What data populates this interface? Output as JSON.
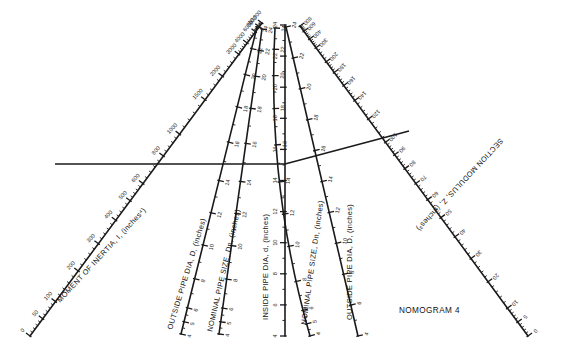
{
  "figure": {
    "caption": "NOMOGRAM 4",
    "background_color": "#ffffff",
    "ink_color": "#1a1a1a",
    "width": 565,
    "height": 359
  },
  "chart_data": {
    "type": "nomogram",
    "title": "NOMOGRAM 4",
    "grid": false,
    "legend": "none",
    "scales": [
      {
        "id": "moment-of-inertia",
        "name": "MOMENT OF INERTIA, I, (inches⁴)",
        "symbol": "I",
        "units": "inches^4",
        "orientation": "oblique-left-arm",
        "position": "far-left, rising to upper-centre",
        "label_rotation_deg": -47,
        "tick_labels": [
          "0",
          "50",
          "100",
          "200",
          "300",
          "400",
          "500",
          "600",
          "800",
          "1000",
          "1500",
          "2000",
          "3000",
          "4000",
          "6000",
          "8000",
          "10,000"
        ],
        "min": 0,
        "max": 10000,
        "scale_type": "non-linear"
      },
      {
        "id": "outside-pipe-dia-left",
        "name": "OUTSIDE PIPE DIA, D, (inches)",
        "symbol": "D",
        "units": "inches",
        "orientation": "oblique",
        "position": "left-of-centre",
        "label_rotation_deg": -72,
        "tick_labels": [
          "4",
          "5",
          "6",
          "8",
          "10",
          "12",
          "14",
          "16",
          "18",
          "20",
          "22",
          "24"
        ],
        "min": 4,
        "max": 24,
        "scale_type": "linear"
      },
      {
        "id": "nominal-pipe-size-left",
        "name": "NOMINAL PIPE SIZE, Dn, (inches)",
        "symbol": "Dn",
        "units": "inches",
        "orientation": "oblique",
        "position": "left-of-centre, inner",
        "label_rotation_deg": -78,
        "tick_labels": [
          "4",
          "5",
          "6",
          "8",
          "10",
          "12",
          "14",
          "16",
          "18",
          "20",
          "22",
          "24"
        ],
        "min": 4,
        "max": 24,
        "scale_type": "linear"
      },
      {
        "id": "inside-pipe-dia",
        "name": "INSIDE PIPE DIA, d, (inches)",
        "symbol": "d",
        "units": "inches",
        "orientation": "vertical",
        "position": "centre",
        "label_rotation_deg": -90,
        "tick_labels": [
          "4",
          "6",
          "8",
          "10",
          "12",
          "14",
          "16",
          "18",
          "20",
          "22",
          "24"
        ],
        "min": 4,
        "max": 24,
        "scale_type": "linear"
      },
      {
        "id": "nominal-pipe-size-right",
        "name": "NOMINAL PIPE SIZE, Dn, (inches)",
        "symbol": "Dn",
        "units": "inches",
        "orientation": "curved",
        "position": "right-of-centre, inner",
        "label_rotation_deg": -83,
        "tick_labels": [
          "4",
          "5",
          "6",
          "8",
          "10",
          "12",
          "14",
          "16",
          "18",
          "20",
          "22",
          "24"
        ],
        "min": 4,
        "max": 24,
        "scale_type": "non-linear"
      },
      {
        "id": "outside-pipe-dia-right",
        "name": "OUTSIDE PIPE DIA, D, (inches)",
        "symbol": "D",
        "units": "inches",
        "orientation": "oblique",
        "position": "right-of-centre",
        "label_rotation_deg": -90,
        "tick_labels": [
          "4",
          "6",
          "8",
          "10",
          "12",
          "14",
          "16",
          "18",
          "20",
          "22",
          "24"
        ],
        "min": 4,
        "max": 24,
        "scale_type": "linear"
      },
      {
        "id": "section-modulus",
        "name": "SECTION MODULUS, Z, (inches³)",
        "symbol": "Z",
        "units": "inches^3",
        "orientation": "oblique-right-arm",
        "position": "far-right, descending from upper-centre",
        "label_rotation_deg": 47,
        "label_flipped": true,
        "tick_labels": [
          "0",
          "5",
          "10",
          "20",
          "30",
          "40",
          "50",
          "60",
          "70",
          "80",
          "90",
          "100",
          "120",
          "140",
          "160",
          "180",
          "200",
          "300",
          "400",
          "600",
          "800"
        ],
        "min": 0,
        "max": 800,
        "scale_type": "non-linear"
      }
    ],
    "isopleth": {
      "description": "Index line example drawn across the chart",
      "readings": [
        {
          "scale": "moment-of-inertia",
          "value": "800"
        },
        {
          "scale": "outside-pipe-dia-left",
          "value": "14"
        },
        {
          "scale": "nominal-pipe-size-left",
          "value": "14"
        },
        {
          "scale": "inside-pipe-dia",
          "value": "12"
        },
        {
          "scale": "nominal-pipe-size-right",
          "value": "14"
        },
        {
          "scale": "outside-pipe-dia-right",
          "value": "14"
        },
        {
          "scale": "section-modulus",
          "value": "100"
        }
      ]
    }
  },
  "axis_labels": {
    "moment_of_inertia": "MOMENT OF INERTIA, I, (inches⁴)",
    "outside_pipe_dia_left": "OUTSIDE PIPE DIA, D, (inches)",
    "nominal_pipe_size_left": "NOMINAL PIPE SIZE, Dn, (inches)",
    "inside_pipe_dia": "INSIDE PIPE DIA, d, (inches)",
    "nominal_pipe_size_right": "NOMINAL PIPE SIZE, Dn, (inches)",
    "outside_pipe_dia_right": "OUTSIDE PIPE DIA, D, (inches)",
    "section_modulus": "SECTION MODULUS, Z, (inches³)"
  },
  "ticks": {
    "moment_of_inertia": [
      {
        "v": "0",
        "t": 0.0
      },
      {
        "v": "50",
        "t": 0.055
      },
      {
        "v": "100",
        "t": 0.11
      },
      {
        "v": "200",
        "t": 0.208
      },
      {
        "v": "300",
        "t": 0.295
      },
      {
        "v": "400",
        "t": 0.37
      },
      {
        "v": "500",
        "t": 0.432
      },
      {
        "v": "600",
        "t": 0.487
      },
      {
        "v": "800",
        "t": 0.575
      },
      {
        "v": "1000",
        "t": 0.645
      },
      {
        "v": "1500",
        "t": 0.755
      },
      {
        "v": "2000",
        "t": 0.83
      },
      {
        "v": "3000",
        "t": 0.9
      },
      {
        "v": "4000",
        "t": 0.936
      },
      {
        "v": "6000",
        "t": 0.972
      },
      {
        "v": "8000",
        "t": 0.988
      },
      {
        "v": "10,000",
        "t": 1.0
      }
    ],
    "outside_pipe_dia_left": [
      {
        "v": "4",
        "t": 0.0
      },
      {
        "v": "5",
        "t": 0.04
      },
      {
        "v": "6",
        "t": 0.085
      },
      {
        "v": "8",
        "t": 0.18
      },
      {
        "v": "10",
        "t": 0.29
      },
      {
        "v": "12",
        "t": 0.395
      },
      {
        "v": "14",
        "t": 0.5
      },
      {
        "v": "16",
        "t": 0.625
      },
      {
        "v": "18",
        "t": 0.74
      },
      {
        "v": "20",
        "t": 0.845
      },
      {
        "v": "22",
        "t": 0.93
      },
      {
        "v": "24",
        "t": 1.0
      }
    ],
    "nominal_pipe_size_left": [
      {
        "v": "4",
        "t": 0.0
      },
      {
        "v": "5",
        "t": 0.04
      },
      {
        "v": "6",
        "t": 0.085
      },
      {
        "v": "8",
        "t": 0.18
      },
      {
        "v": "10",
        "t": 0.29
      },
      {
        "v": "12",
        "t": 0.395
      },
      {
        "v": "14",
        "t": 0.5
      },
      {
        "v": "16",
        "t": 0.625
      },
      {
        "v": "18",
        "t": 0.74
      },
      {
        "v": "20",
        "t": 0.845
      },
      {
        "v": "22",
        "t": 0.93
      },
      {
        "v": "24",
        "t": 1.0
      }
    ],
    "inside_pipe_dia": [
      {
        "v": "4",
        "t": 0.0
      },
      {
        "v": "6",
        "t": 0.1
      },
      {
        "v": "8",
        "t": 0.2
      },
      {
        "v": "10",
        "t": 0.3
      },
      {
        "v": "12",
        "t": 0.4
      },
      {
        "v": "14",
        "t": 0.5
      },
      {
        "v": "16",
        "t": 0.6
      },
      {
        "v": "18",
        "t": 0.7
      },
      {
        "v": "20",
        "t": 0.8
      },
      {
        "v": "22",
        "t": 0.9
      },
      {
        "v": "24",
        "t": 1.0
      }
    ],
    "nominal_pipe_size_right": [
      {
        "v": "4",
        "t": 0.0
      },
      {
        "v": "5",
        "t": 0.04
      },
      {
        "v": "6",
        "t": 0.085
      },
      {
        "v": "8",
        "t": 0.18
      },
      {
        "v": "10",
        "t": 0.295
      },
      {
        "v": "12",
        "t": 0.4
      },
      {
        "v": "14",
        "t": 0.505
      },
      {
        "v": "16",
        "t": 0.625
      },
      {
        "v": "18",
        "t": 0.742
      },
      {
        "v": "20",
        "t": 0.848
      },
      {
        "v": "22",
        "t": 0.932
      },
      {
        "v": "24",
        "t": 1.0
      }
    ],
    "outside_pipe_dia_right": [
      {
        "v": "4",
        "t": 0.0
      },
      {
        "v": "6",
        "t": 0.1
      },
      {
        "v": "8",
        "t": 0.2
      },
      {
        "v": "10",
        "t": 0.3
      },
      {
        "v": "12",
        "t": 0.4
      },
      {
        "v": "14",
        "t": 0.5
      },
      {
        "v": "16",
        "t": 0.6
      },
      {
        "v": "18",
        "t": 0.7
      },
      {
        "v": "20",
        "t": 0.8
      },
      {
        "v": "22",
        "t": 0.9
      },
      {
        "v": "24",
        "t": 1.0
      }
    ],
    "section_modulus": [
      {
        "v": "0",
        "t": 0.0
      },
      {
        "v": "5",
        "t": 0.045
      },
      {
        "v": "10",
        "t": 0.09
      },
      {
        "v": "20",
        "t": 0.175
      },
      {
        "v": "30",
        "t": 0.25
      },
      {
        "v": "40",
        "t": 0.32
      },
      {
        "v": "50",
        "t": 0.382
      },
      {
        "v": "60",
        "t": 0.44
      },
      {
        "v": "70",
        "t": 0.492
      },
      {
        "v": "80",
        "t": 0.54
      },
      {
        "v": "90",
        "t": 0.585
      },
      {
        "v": "100",
        "t": 0.625
      },
      {
        "v": "120",
        "t": 0.7
      },
      {
        "v": "140",
        "t": 0.76
      },
      {
        "v": "160",
        "t": 0.808
      },
      {
        "v": "180",
        "t": 0.85
      },
      {
        "v": "200",
        "t": 0.885
      },
      {
        "v": "300",
        "t": 0.93
      },
      {
        "v": "400",
        "t": 0.958
      },
      {
        "v": "600",
        "t": 0.983
      },
      {
        "v": "800",
        "t": 1.0
      }
    ]
  }
}
